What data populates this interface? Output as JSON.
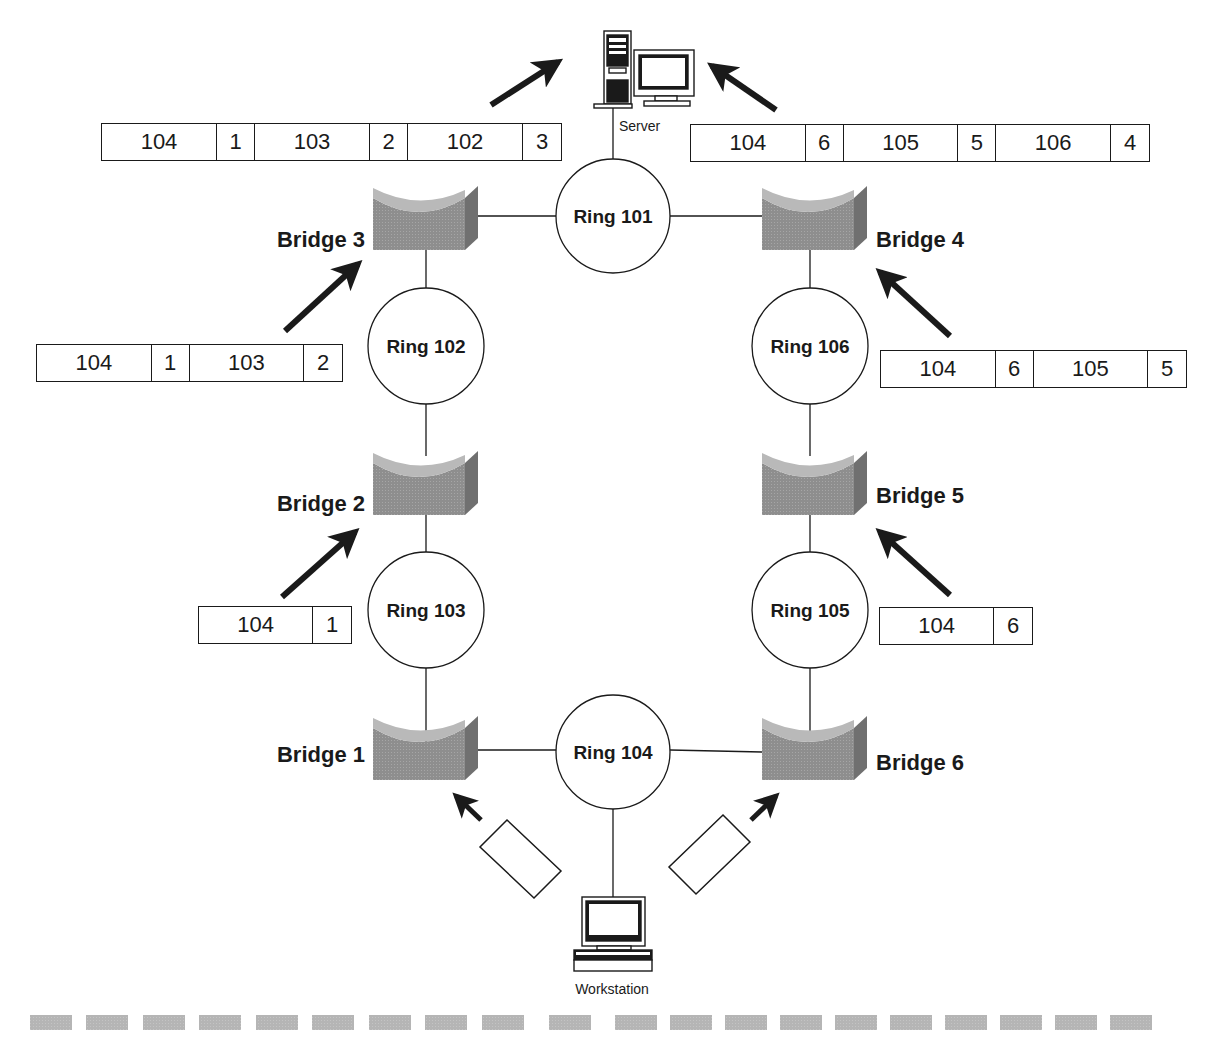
{
  "diagram": {
    "type": "source-route-bridging",
    "devices": {
      "server_label": "Server",
      "workstation_label": "Workstation"
    },
    "rings": [
      {
        "id": "ring-101",
        "label": "Ring 101"
      },
      {
        "id": "ring-102",
        "label": "Ring 102"
      },
      {
        "id": "ring-103",
        "label": "Ring 103"
      },
      {
        "id": "ring-104",
        "label": "Ring 104"
      },
      {
        "id": "ring-105",
        "label": "Ring 105"
      },
      {
        "id": "ring-106",
        "label": "Ring 106"
      }
    ],
    "bridges": [
      {
        "id": "bridge-1",
        "label": "Bridge 1"
      },
      {
        "id": "bridge-2",
        "label": "Bridge 2"
      },
      {
        "id": "bridge-3",
        "label": "Bridge 3"
      },
      {
        "id": "bridge-4",
        "label": "Bridge 4"
      },
      {
        "id": "bridge-5",
        "label": "Bridge 5"
      },
      {
        "id": "bridge-6",
        "label": "Bridge 6"
      }
    ],
    "route_frames": {
      "left_top": [
        "104",
        "1",
        "103",
        "2",
        "102",
        "3"
      ],
      "right_top": [
        "104",
        "6",
        "105",
        "5",
        "106",
        "4"
      ],
      "left_mid": [
        "104",
        "1",
        "103",
        "2"
      ],
      "right_mid": [
        "104",
        "6",
        "105",
        "5"
      ],
      "left_low": [
        "104",
        "1"
      ],
      "right_low": [
        "104",
        "6"
      ],
      "left_empty": [],
      "right_empty": []
    },
    "colors": {
      "line": "#1a1a1a",
      "bridge_face": "#8c8c8c",
      "bridge_top": "#b4b4b4",
      "bridge_side": "#6a6a6a",
      "footer_dash": "#b8b8b8"
    }
  }
}
